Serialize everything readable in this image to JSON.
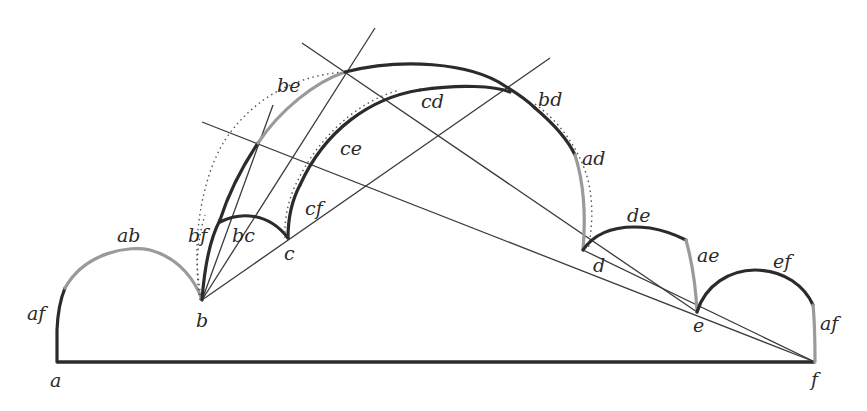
{
  "diagram": {
    "type": "geometric construction (folding / circle arcs)",
    "points": {
      "a": "a",
      "b": "b",
      "c": "c",
      "d": "d",
      "e": "e",
      "f": "f"
    },
    "arc_labels": {
      "af_left": "af",
      "ab": "ab",
      "bf": "bf",
      "bc": "bc",
      "cf": "cf",
      "ce": "ce",
      "be": "be",
      "cd": "cd",
      "bd": "bd",
      "ad": "ad",
      "de": "de",
      "ae": "ae",
      "ef": "ef",
      "af_right": "af"
    },
    "colors": {
      "dark_arc": "#2b2b2b",
      "grey_arc": "#9a9a9a",
      "line": "#3a3a3a",
      "background": "#ffffff"
    }
  }
}
